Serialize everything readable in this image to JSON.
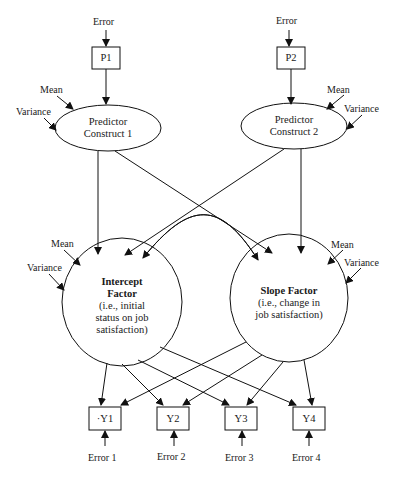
{
  "diagram": {
    "type": "latent growth model path diagram",
    "observed_predictors": [
      {
        "id": "P1",
        "label": "P1",
        "error_label": "Error"
      },
      {
        "id": "P2",
        "label": "P2",
        "error_label": "Error"
      }
    ],
    "predictor_constructs": [
      {
        "id": "pc1",
        "line1": "Predictor",
        "line2": "Construct 1",
        "mean_label": "Mean",
        "variance_label": "Variance"
      },
      {
        "id": "pc2",
        "line1": "Predictor",
        "line2": "Construct 2",
        "mean_label": "Mean",
        "variance_label": "Variance"
      }
    ],
    "factors": [
      {
        "id": "intercept",
        "title1": "Intercept",
        "title2": "Factor",
        "desc1": "(i.e., initial",
        "desc2": "status on job",
        "desc3": "satisfaction)",
        "mean_label": "Mean",
        "variance_label": "Variance"
      },
      {
        "id": "slope",
        "title1": "Slope Factor",
        "desc1": "(i.e., change in",
        "desc2": "job satisfaction)",
        "mean_label": "Mean",
        "variance_label": "Variance"
      }
    ],
    "indicators": [
      {
        "id": "Y1",
        "label": "·Y1",
        "error_label": "Error 1"
      },
      {
        "id": "Y2",
        "label": "Y2",
        "error_label": "Error 2"
      },
      {
        "id": "Y3",
        "label": "Y3",
        "error_label": "Error 3"
      },
      {
        "id": "Y4",
        "label": "Y4",
        "error_label": "Error 4"
      }
    ],
    "paths": [
      {
        "from": "P1",
        "to": "pc1"
      },
      {
        "from": "P2",
        "to": "pc2"
      },
      {
        "from": "pc1",
        "to": "intercept"
      },
      {
        "from": "pc1",
        "to": "slope"
      },
      {
        "from": "pc2",
        "to": "intercept"
      },
      {
        "from": "pc2",
        "to": "slope"
      },
      {
        "from": "intercept",
        "to": "slope",
        "type": "covariance"
      },
      {
        "from": "intercept",
        "to": "Y1"
      },
      {
        "from": "intercept",
        "to": "Y2"
      },
      {
        "from": "intercept",
        "to": "Y3"
      },
      {
        "from": "intercept",
        "to": "Y4"
      },
      {
        "from": "slope",
        "to": "Y1"
      },
      {
        "from": "slope",
        "to": "Y2"
      },
      {
        "from": "slope",
        "to": "Y3"
      },
      {
        "from": "slope",
        "to": "Y4"
      }
    ]
  }
}
